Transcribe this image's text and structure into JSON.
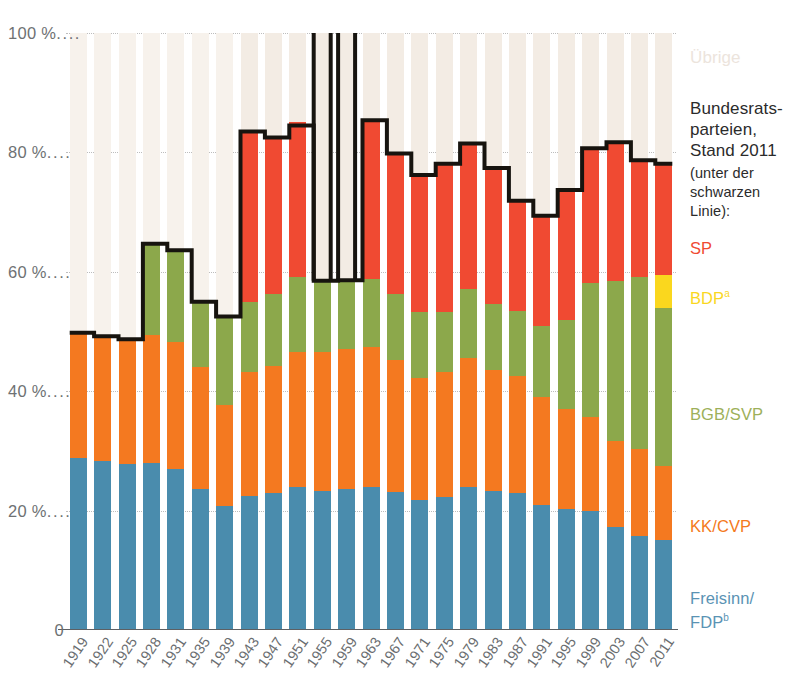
{
  "legend": {
    "others_label": "Übrige",
    "heading": "Bundesrats-\nparteien,\nStand 2011",
    "subheading": "(unter der\nschwarzen\nLinie):",
    "entries": [
      {
        "key": "sp",
        "label": "SP",
        "note": "",
        "color": "#f04a32"
      },
      {
        "key": "bdp",
        "label": "BDP",
        "note": "a",
        "color": "#fad71e"
      },
      {
        "key": "svp",
        "label": "BGB/SVP",
        "note": "",
        "color": "#9db05a"
      },
      {
        "key": "cvp",
        "label": "KK/CVP",
        "note": "",
        "color": "#f47920"
      },
      {
        "key": "fdp",
        "label": "Freisinn/\nFDP",
        "note": "b",
        "color": "#5a93b4"
      }
    ]
  },
  "colors": {
    "sp": "#f04a32",
    "bdp": "#fad71e",
    "svp": "#8ca84b",
    "cvp": "#f47920",
    "fdp": "#4a8cad",
    "others": "#f3ece4",
    "others_pale": "#f7f2ec",
    "govline": "#17140f",
    "axis": "#5d6063",
    "grid": "#a8a8a8",
    "tick_text": "#6e7173"
  },
  "yaxis": {
    "ticks": [
      {
        "value": 100,
        "label": "100 %"
      },
      {
        "value": 80,
        "label": "80 %"
      },
      {
        "value": 60,
        "label": "60 %"
      },
      {
        "value": 40,
        "label": "40 %"
      },
      {
        "value": 20,
        "label": "20 %"
      },
      {
        "value": 0,
        "label": "0"
      }
    ],
    "min": 0,
    "max": 100,
    "dots": "...."
  },
  "chart_data": {
    "type": "bar",
    "subtype": "stacked-bar-with-threshold-line",
    "title": "",
    "subtitle": "",
    "xlabel": "",
    "ylabel": "",
    "ylim": [
      0,
      100
    ],
    "grid": true,
    "legend_position": "right",
    "stack_order_bottom_to_top": [
      "fdp",
      "cvp",
      "svp",
      "bdp",
      "sp",
      "others"
    ],
    "categories": [
      "1919",
      "1922",
      "1925",
      "1928",
      "1931",
      "1935",
      "1939",
      "1943",
      "1947",
      "1951",
      "1955",
      "1959",
      "1963",
      "1967",
      "1971",
      "1975",
      "1979",
      "1983",
      "1987",
      "1991",
      "1995",
      "1999",
      "2003",
      "2007",
      "2011"
    ],
    "series": [
      {
        "name": "Freisinn/FDP",
        "key": "fdp",
        "color": "#4a8cad",
        "values": [
          28.8,
          28.3,
          27.8,
          28.0,
          26.9,
          23.7,
          20.7,
          22.5,
          23.0,
          24.0,
          23.3,
          23.7,
          24.0,
          23.2,
          21.8,
          22.2,
          24.0,
          23.3,
          22.9,
          21.0,
          20.2,
          19.9,
          17.3,
          15.8,
          15.1
        ]
      },
      {
        "name": "KK/CVP",
        "key": "cvp",
        "color": "#f47920",
        "values": [
          21.0,
          20.9,
          20.9,
          21.4,
          21.4,
          20.3,
          17.0,
          20.8,
          21.2,
          22.5,
          23.2,
          23.3,
          23.4,
          22.1,
          20.4,
          21.1,
          21.5,
          20.2,
          19.6,
          18.0,
          16.8,
          15.8,
          14.4,
          14.5,
          12.3
        ]
      },
      {
        "name": "BGB/SVP",
        "key": "svp",
        "color": "#8ca84b",
        "values": [
          0.0,
          0.0,
          0.0,
          15.3,
          15.3,
          11.0,
          14.7,
          11.6,
          12.1,
          12.6,
          12.1,
          11.6,
          11.4,
          11.0,
          11.1,
          9.9,
          11.6,
          11.1,
          11.0,
          11.9,
          14.9,
          22.5,
          26.7,
          28.9,
          26.6
        ]
      },
      {
        "name": "BDP",
        "key": "bdp",
        "color": "#fad71e",
        "values": [
          0,
          0,
          0,
          0,
          0,
          0,
          0,
          0,
          0,
          0,
          0,
          0,
          0,
          0,
          0,
          0,
          0,
          0,
          0,
          0,
          0,
          0,
          0,
          0,
          5.4
        ]
      },
      {
        "name": "SP",
        "key": "sp",
        "color": "#f04a32",
        "values": [
          23.5,
          23.3,
          25.8,
          27.4,
          28.7,
          28.0,
          25.9,
          28.6,
          26.2,
          26.0,
          27.0,
          26.4,
          26.6,
          23.5,
          22.9,
          24.9,
          24.4,
          22.8,
          18.4,
          18.5,
          21.8,
          22.5,
          23.3,
          19.5,
          18.7
        ]
      },
      {
        "name": "Übrige",
        "key": "others",
        "color": "#f3ece4",
        "values": [
          26.7,
          27.5,
          25.5,
          7.9,
          7.7,
          17.0,
          21.7,
          16.5,
          17.5,
          14.9,
          14.4,
          15.0,
          14.6,
          20.2,
          23.8,
          21.9,
          18.5,
          22.6,
          28.1,
          30.6,
          26.3,
          19.3,
          18.3,
          21.3,
          21.9
        ]
      }
    ],
    "government_line": {
      "name": "Bundesratsparteien (Stand 2011)",
      "color": "#17140f",
      "description": "Kumulierter Wähleranteil der 2011 im Bundesrat vertretenen Parteien",
      "values": [
        49.8,
        49.2,
        48.7,
        64.7,
        63.6,
        55.0,
        52.5,
        83.5,
        82.5,
        84.5,
        58.5,
        58.6,
        85.4,
        79.8,
        76.2,
        78.1,
        81.5,
        77.4,
        71.9,
        69.4,
        73.7,
        80.7,
        81.7,
        78.7,
        78.1
      ]
    },
    "government_line_membership": {
      "description": "In welchen Jahren welche Partei unter der schwarzen Linie mitgezählt wird",
      "by_year": {
        "1919": [
          "fdp",
          "cvp"
        ],
        "1922": [
          "fdp",
          "cvp"
        ],
        "1925": [
          "fdp",
          "cvp"
        ],
        "1928": [
          "fdp",
          "cvp",
          "svp"
        ],
        "1931": [
          "fdp",
          "cvp",
          "svp"
        ],
        "1935": [
          "fdp",
          "cvp",
          "svp"
        ],
        "1939": [
          "fdp",
          "cvp",
          "svp"
        ],
        "1943": [
          "fdp",
          "cvp",
          "svp",
          "sp"
        ],
        "1947": [
          "fdp",
          "cvp",
          "svp",
          "sp"
        ],
        "1951": [
          "fdp",
          "cvp",
          "svp",
          "sp"
        ],
        "1955": [
          "fdp",
          "cvp",
          "svp"
        ],
        "1959": [
          "fdp",
          "cvp",
          "svp"
        ],
        "1963": [
          "fdp",
          "cvp",
          "svp",
          "sp"
        ],
        "1967": [
          "fdp",
          "cvp",
          "svp",
          "sp"
        ],
        "1971": [
          "fdp",
          "cvp",
          "svp",
          "sp"
        ],
        "1975": [
          "fdp",
          "cvp",
          "svp",
          "sp"
        ],
        "1979": [
          "fdp",
          "cvp",
          "svp",
          "sp"
        ],
        "1983": [
          "fdp",
          "cvp",
          "svp",
          "sp"
        ],
        "1987": [
          "fdp",
          "cvp",
          "svp",
          "sp"
        ],
        "1991": [
          "fdp",
          "cvp",
          "svp",
          "sp"
        ],
        "1995": [
          "fdp",
          "cvp",
          "svp",
          "sp"
        ],
        "1999": [
          "fdp",
          "cvp",
          "svp",
          "sp"
        ],
        "2003": [
          "fdp",
          "cvp",
          "svp",
          "sp"
        ],
        "2007": [
          "fdp",
          "cvp",
          "svp",
          "sp"
        ],
        "2011": [
          "fdp",
          "cvp",
          "svp",
          "bdp",
          "sp"
        ]
      }
    },
    "faded_years": [
      "1919",
      "1922",
      "1925",
      "1928",
      "1931",
      "1935",
      "1939"
    ],
    "faded_note": "Balkenteile oberhalb der schwarzen Linie sind blass dargestellt"
  }
}
